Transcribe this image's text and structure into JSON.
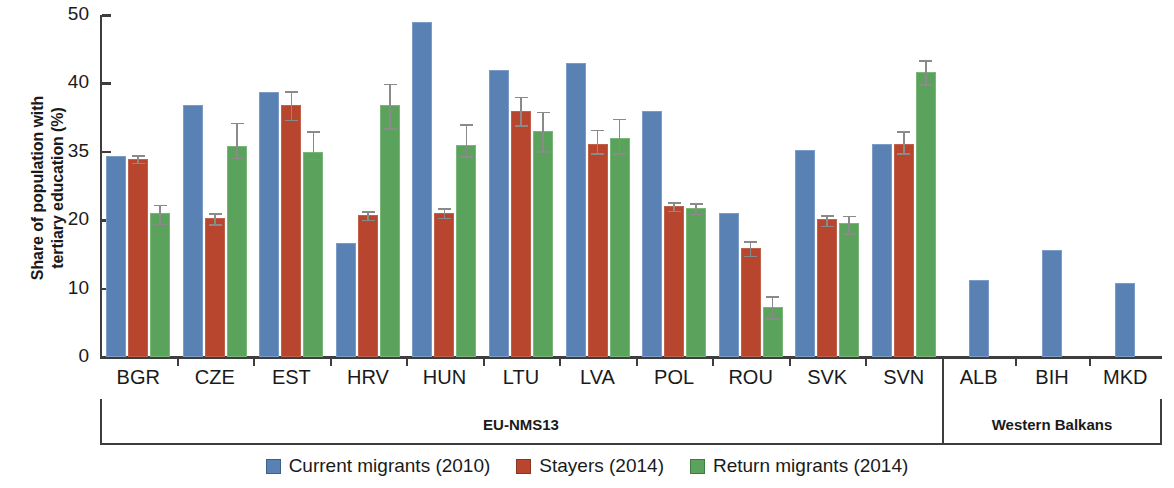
{
  "chart_data": {
    "type": "bar",
    "title": "",
    "xlabel": "",
    "ylabel": "Share of population with\ntertiary education (%)",
    "ylim": [
      0,
      50
    ],
    "ytick_labels": [
      "50",
      "40",
      "35",
      "20",
      "10",
      "0"
    ],
    "ytick_values": [
      50,
      40,
      35,
      20,
      10,
      0
    ],
    "grid": false,
    "legend_position": "bottom-center",
    "categories": [
      "BGR",
      "CZE",
      "EST",
      "HRV",
      "HUN",
      "LTU",
      "LVA",
      "POL",
      "ROU",
      "SVK",
      "SVN",
      "ALB",
      "BIH",
      "MKD"
    ],
    "group_bands": [
      {
        "label": "EU-NMS13",
        "categories": [
          "BGR",
          "CZE",
          "EST",
          "HRV",
          "HUN",
          "LTU",
          "LVA",
          "POL",
          "ROU",
          "SVK",
          "SVN"
        ]
      },
      {
        "label": "Western Balkans",
        "categories": [
          "ALB",
          "BIH",
          "MKD"
        ]
      }
    ],
    "series": [
      {
        "name": "Current migrants (2010)",
        "color": "#5a81b4",
        "values": [
          34.0,
          38.4,
          39.4,
          16.7,
          49.0,
          42.0,
          43.0,
          38.0,
          21.6,
          35.1,
          35.6,
          11.2,
          15.6,
          10.8
        ],
        "errors": [
          null,
          null,
          null,
          null,
          null,
          null,
          null,
          null,
          null,
          null,
          null,
          null,
          null,
          null
        ]
      },
      {
        "name": "Stayers (2014)",
        "color": "#b8462f",
        "values": [
          33.5,
          20.5,
          38.4,
          21.1,
          21.6,
          38.0,
          35.6,
          23.1,
          15.9,
          20.2,
          35.6,
          null,
          null,
          null
        ],
        "errors": [
          1.0,
          1.2,
          1.1,
          1.1,
          1.2,
          1.1,
          1.1,
          1.1,
          1.2,
          1.1,
          1.0,
          null,
          null,
          null
        ]
      },
      {
        "name": "Return migrants (2014)",
        "color": "#5ba35c",
        "values": [
          21.5,
          35.4,
          35.0,
          38.4,
          35.5,
          36.5,
          36.0,
          22.6,
          7.3,
          19.6,
          41.7,
          null,
          null,
          null
        ],
        "errors": [
          2.1,
          1.8,
          1.6,
          1.7,
          1.6,
          1.5,
          1.5,
          1.3,
          1.7,
          1.6,
          1.8,
          null,
          null,
          null
        ]
      }
    ],
    "legend": [
      {
        "label": "Current migrants (2010)",
        "color": "#5a81b4"
      },
      {
        "label": "Stayers (2014)",
        "color": "#b8462f"
      },
      {
        "label": "Return migrants (2014)",
        "color": "#5ba35c"
      }
    ]
  }
}
